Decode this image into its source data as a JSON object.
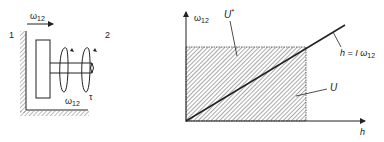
{
  "left_diagram": {
    "body_label_1": "1",
    "body_label_2": "2",
    "top_arrow_label": "ω",
    "top_arrow_sub": "12",
    "rotation_label": "ω",
    "rotation_sub": "12",
    "torque_label": "τ"
  },
  "right_diagram": {
    "y_axis_label": "ω",
    "y_axis_sub": "12",
    "x_axis_label": "h",
    "upper_region_label": "U",
    "upper_region_sup": "*",
    "lower_region_label": "U",
    "line_label": "h = I ω",
    "line_label_sub": "12"
  },
  "colors": {
    "ink": "#222222",
    "background": "#ffffff"
  }
}
